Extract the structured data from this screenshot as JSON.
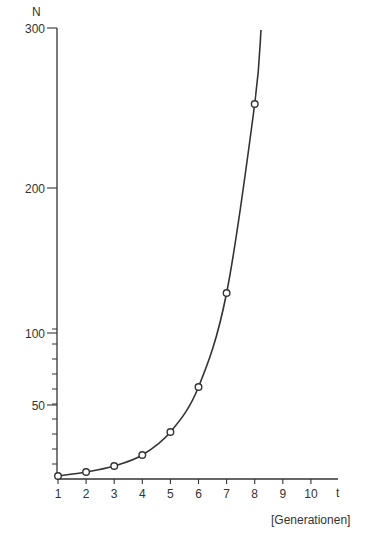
{
  "chart_data": {
    "type": "line",
    "title": "",
    "xlabel": "t",
    "xlabel_unit": "[Generationen]",
    "ylabel": "N",
    "x": [
      1,
      2,
      3,
      4,
      5,
      6,
      7,
      8
    ],
    "series": [
      {
        "name": "N",
        "values": [
          2,
          4,
          8,
          16,
          32,
          64,
          128,
          256
        ],
        "markers": "open-circle",
        "curve": "smooth exponential"
      }
    ],
    "xticks": [
      "1",
      "2",
      "3",
      "4",
      "5",
      "6",
      "7",
      "8",
      "9",
      "10"
    ],
    "yticks": [
      "50",
      "100",
      "200",
      "300"
    ],
    "y_minor_tick_step": 10,
    "xlim": [
      1,
      10
    ],
    "ylim": [
      0,
      300
    ],
    "grid": false,
    "legend": null
  },
  "colors": {
    "ink": "#333333",
    "background": "#ffffff"
  }
}
